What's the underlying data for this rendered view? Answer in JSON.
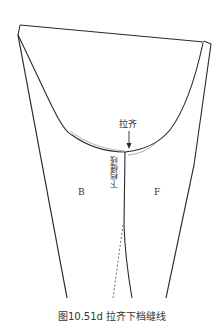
{
  "diagram": {
    "annotation_align": "拉齐",
    "label_back": "B",
    "label_front": "F",
    "label_seam": "下档缝线",
    "caption": "图10.51d 拉齐下档缝线",
    "stroke_color": "#2a2a2a",
    "seam_highlight_color": "#9a9a9a"
  }
}
